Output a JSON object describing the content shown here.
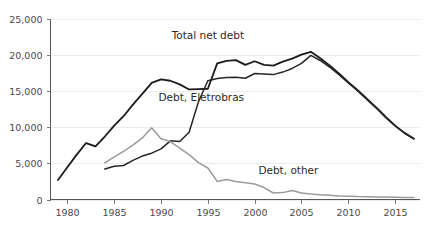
{
  "chart_data": {
    "type": "line",
    "title": "",
    "subtitle": "",
    "xlabel": "",
    "ylabel": "",
    "xlim": [
      1978.2,
      2017.6
    ],
    "ylim": [
      0,
      25000
    ],
    "grid": true,
    "legend_position": "inline-annotations",
    "x_ticks": [
      "1980",
      "1985",
      "1990",
      "1995",
      "2000",
      "2005",
      "2010",
      "2015"
    ],
    "x_tick_values": [
      1980,
      1985,
      1990,
      1995,
      2000,
      2005,
      2010,
      2015
    ],
    "y_ticks": [
      "0",
      "5,000",
      "10,000",
      "15,000",
      "20,000",
      "25,000"
    ],
    "y_tick_values": [
      0,
      5000,
      10000,
      15000,
      20000,
      25000
    ],
    "annotations": [
      {
        "name": "total-net-debt-label",
        "text": "Total net debt",
        "x": 1995.0,
        "y": 22200
      },
      {
        "name": "debt-eletrobras-label",
        "text": "Debt, Eletrobras",
        "x": 1994.3,
        "y": 13600
      },
      {
        "name": "debt-other-label",
        "text": "Debt, other",
        "x": 2003.6,
        "y": 3500
      }
    ],
    "series": [
      {
        "name": "Total net debt",
        "color": "#1b1b1b",
        "width": 1.8,
        "x": [
          1979,
          1980,
          1981,
          1982,
          1983,
          1984,
          1985,
          1986,
          1987,
          1988,
          1989,
          1990,
          1991,
          1992,
          1993,
          1994,
          1995,
          1996,
          1997,
          1998,
          1999,
          2000,
          2001,
          2002,
          2003,
          2004,
          2005,
          2006,
          2007,
          2008,
          2009,
          2010,
          2011,
          2012,
          2013,
          2014,
          2015,
          2016,
          2017
        ],
        "values": [
          2700,
          4450,
          6200,
          7800,
          7350,
          8700,
          10200,
          11500,
          13100,
          14600,
          16100,
          16600,
          16400,
          15900,
          15200,
          15250,
          15300,
          18800,
          19150,
          19250,
          18600,
          19100,
          18600,
          18500,
          19050,
          19450,
          20000,
          20400,
          19500,
          18500,
          17400,
          16200,
          15100,
          13900,
          12700,
          11400,
          10200,
          9200,
          8400
        ]
      },
      {
        "name": "Debt, Eletrobras",
        "color": "#262626",
        "width": 1.5,
        "x": [
          1984,
          1985,
          1986,
          1987,
          1988,
          1989,
          1990,
          1991,
          1992,
          1993,
          1994,
          1995,
          1996,
          1997,
          1998,
          1999,
          2000,
          2001,
          2002,
          2003,
          2004,
          2005,
          2006,
          2007,
          2008,
          2009,
          2010,
          2011,
          2012,
          2013,
          2014,
          2015,
          2016,
          2017
        ],
        "values": [
          4200,
          4600,
          4700,
          5400,
          6000,
          6400,
          7000,
          8100,
          8000,
          9300,
          13500,
          16400,
          16700,
          16850,
          16900,
          16750,
          17400,
          17350,
          17250,
          17600,
          18100,
          18800,
          19900,
          19200,
          18300,
          17250,
          16100,
          15000,
          13800,
          12600,
          11300,
          10150,
          9150,
          8400
        ]
      },
      {
        "name": "Debt, other",
        "color": "#9b9b9b",
        "width": 1.5,
        "x": [
          1984,
          1985,
          1986,
          1987,
          1988,
          1989,
          1990,
          1991,
          1992,
          1993,
          1994,
          1995,
          1996,
          1997,
          1998,
          1999,
          2000,
          2001,
          2002,
          2003,
          2004,
          2005,
          2006,
          2007,
          2008,
          2009,
          2010,
          2011,
          2012,
          2013,
          2014,
          2015,
          2016,
          2017
        ],
        "values": [
          5050,
          5900,
          6650,
          7500,
          8500,
          9900,
          8400,
          8000,
          7100,
          6200,
          5100,
          4350,
          2500,
          2750,
          2500,
          2300,
          2150,
          1650,
          900,
          950,
          1250,
          900,
          750,
          650,
          600,
          500,
          450,
          400,
          380,
          350,
          330,
          300,
          290,
          280
        ]
      }
    ]
  }
}
